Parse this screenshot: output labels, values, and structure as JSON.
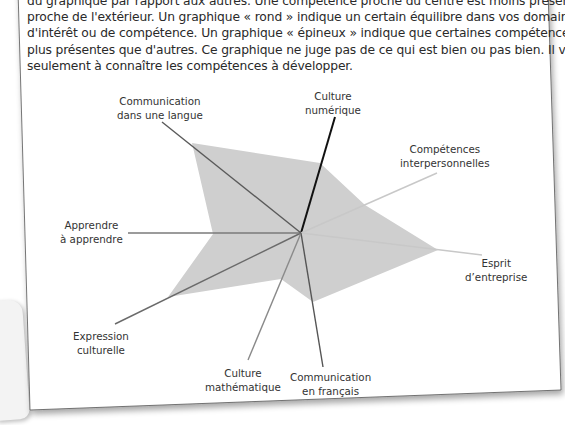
{
  "paragraph": {
    "lines": [
      "du graphique par rapport aux autres. Une compétence proche du centre est moins présente qu'une compé-",
      "par rapport aux autres. Une compétence proche du centre est moins présente qu'une compétence",
      "proche de l'extérieur. Un graphique « rond » indique un certain équilibre dans vos domaines",
      "d'intérêt ou de compétence. Un graphique « épineux » indique que certaines compétences sont",
      "plus présentes que d'autres. Ce graphique ne juge pas de ce qui est bien ou pas bien. Il vous aide",
      "seulement à connaître les compétences à développer."
    ]
  },
  "chart_data": {
    "type": "radar",
    "title": "",
    "center": [
      301,
      233
    ],
    "fill_color": "#cfcfcf",
    "axes": [
      {
        "name": "Culture numérique",
        "label_lines": [
          "Culture",
          "numérique"
        ],
        "value": 0.55,
        "color": "#111111"
      },
      {
        "name": "Compétences interpersonnelles",
        "label_lines": [
          "Compétences",
          "interpersonnelles"
        ],
        "value": 0.45,
        "color": "#c8c8c8"
      },
      {
        "name": "Esprit d'entreprise",
        "label_lines": [
          "Esprit",
          "d’entreprise"
        ],
        "value": 0.77,
        "color": "#c8c8c8"
      },
      {
        "name": "Communication en français",
        "label_lines": [
          "Communication",
          "en français"
        ],
        "value": 0.5,
        "color": "#555555"
      },
      {
        "name": "Culture mathématique",
        "label_lines": [
          "Culture",
          "mathématique"
        ],
        "value": 0.3,
        "color": "#8a8a8a"
      },
      {
        "name": "Expression culturelle",
        "label_lines": [
          "Expression",
          "culturelle"
        ],
        "value": 0.7,
        "color": "#6a6a6a"
      },
      {
        "name": "Apprendre à apprendre",
        "label_lines": [
          "Apprendre",
          "à apprendre"
        ],
        "value": 0.38,
        "color": "#7a7a7a"
      },
      {
        "name": "Communication dans une langue",
        "label_lines": [
          "Communication",
          "dans une langue"
        ],
        "value": 0.9,
        "color": "#5a5a5a"
      }
    ],
    "polygon_points": [
      [
        320,
        163
      ],
      [
        365,
        205
      ],
      [
        438,
        250
      ],
      [
        313,
        302
      ],
      [
        281,
        279
      ],
      [
        168,
        297
      ],
      [
        213,
        234
      ],
      [
        192,
        143
      ]
    ],
    "axis_lines": [
      [
        [
          301,
          233
        ],
        [
          335,
          117
        ]
      ],
      [
        [
          301,
          233
        ],
        [
          437,
          173
        ]
      ],
      [
        [
          301,
          233
        ],
        [
          482,
          255
        ]
      ],
      [
        [
          301,
          233
        ],
        [
          323,
          367
        ]
      ],
      [
        [
          301,
          233
        ],
        [
          248,
          360
        ]
      ],
      [
        [
          301,
          233
        ],
        [
          115,
          324
        ]
      ],
      [
        [
          301,
          233
        ],
        [
          128,
          233
        ]
      ],
      [
        [
          301,
          233
        ],
        [
          162,
          122
        ]
      ]
    ],
    "grid": false,
    "legend": null
  }
}
